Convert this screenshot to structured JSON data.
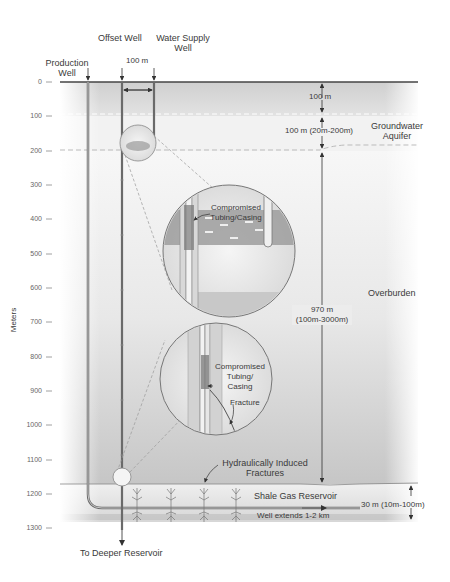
{
  "wells": {
    "production": "Production\nWell",
    "production_line1": "Production",
    "production_line2": "Well",
    "offset": "Offset Well",
    "water_supply_line1": "Water Supply",
    "water_supply_line2": "Well",
    "spacing": "100 m"
  },
  "axis": {
    "label": "Meters",
    "ticks": [
      "0",
      "100",
      "200",
      "300",
      "400",
      "500",
      "600",
      "700",
      "800",
      "900",
      "1000",
      "1100",
      "1200",
      "1300"
    ]
  },
  "layers": {
    "top_thickness": "100 m",
    "aquifer_thickness": "100 m (20m-200m)",
    "aquifer_name_line1": "Groundwater",
    "aquifer_name_line2": "Aquifer",
    "overburden_thickness_line1": "970 m",
    "overburden_thickness_line2": "(100m-3000m)",
    "overburden_name": "Overburden",
    "reservoir_name": "Shale Gas Reservoir",
    "reservoir_thickness": "30 m (10m-100m)"
  },
  "callouts": {
    "upper_line1": "Compromised",
    "upper_line2": "Tubing/Casing",
    "lower_line1": "Compromised",
    "lower_line2": "Tubing/",
    "lower_line3": "Casing",
    "fracture": "Fracture",
    "hydraulic_line1": "Hydraulically Induced",
    "hydraulic_line2": "Fractures",
    "well_extends": "Well extends 1-2 km",
    "deeper": "To Deeper Reservoir"
  },
  "colors": {
    "surface_band": "#d4d4d4",
    "aquifer": "#f1f1f1",
    "overburden_top": "#f4f4f4",
    "overburden_bottom": "#c9c9c9",
    "reservoir": "#e6e6e6",
    "well_line": "#6a6a6a"
  }
}
